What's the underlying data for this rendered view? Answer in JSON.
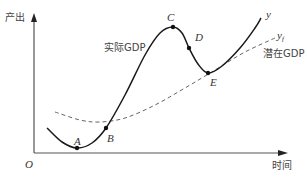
{
  "chart_data": {
    "type": "line",
    "title": "",
    "xlabel": "时间",
    "ylabel": "产出",
    "origin_label": "O",
    "grid": false,
    "series": [
      {
        "name": "实际GDP",
        "end_label": "y",
        "style": "solid",
        "color": "#1a1a1a",
        "points": [
          [
            47,
            128
          ],
          [
            62,
            142
          ],
          [
            77,
            148
          ],
          [
            92,
            143
          ],
          [
            106,
            128
          ],
          [
            125,
            95
          ],
          [
            145,
            55
          ],
          [
            160,
            33
          ],
          [
            173,
            27
          ],
          [
            182,
            33
          ],
          [
            189,
            48
          ],
          [
            198,
            64
          ],
          [
            208,
            73
          ],
          [
            222,
            66
          ],
          [
            240,
            48
          ],
          [
            255,
            28
          ],
          [
            261,
            18
          ]
        ]
      },
      {
        "name": "潜在GDP",
        "end_label": "y_f",
        "style": "dashed",
        "color": "#555555",
        "points": [
          [
            55,
            112
          ],
          [
            80,
            120
          ],
          [
            100,
            122
          ],
          [
            125,
            118
          ],
          [
            155,
            105
          ],
          [
            185,
            88
          ],
          [
            215,
            70
          ],
          [
            245,
            52
          ],
          [
            275,
            38
          ]
        ]
      }
    ],
    "annotations": [
      {
        "label": "A",
        "x": 77,
        "y": 148
      },
      {
        "label": "B",
        "x": 106,
        "y": 128
      },
      {
        "label": "C",
        "x": 173,
        "y": 27
      },
      {
        "label": "D",
        "x": 189,
        "y": 48
      },
      {
        "label": "E",
        "x": 208,
        "y": 73
      }
    ]
  },
  "labels": {
    "y_axis": "产出",
    "x_axis": "时间",
    "origin": "O",
    "actual_gdp": "实际GDP",
    "potential_gdp": "潜在GDP",
    "y": "y",
    "yf_main": "y",
    "yf_sub": "f",
    "A": "A",
    "B": "B",
    "C": "C",
    "D": "D",
    "E": "E"
  }
}
